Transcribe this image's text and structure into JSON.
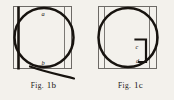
{
  "page": {
    "background_color": "#f3f1ec",
    "ink_color": "#17130f"
  },
  "figures": [
    {
      "id": "fig-1b",
      "caption_prefix": "Fig.",
      "caption_number": "1b",
      "caption_full": "Fig. 1b",
      "labels": [
        {
          "text": "a",
          "position": "top-inside-circle"
        },
        {
          "text": "b",
          "position": "bottom-inside-circle"
        }
      ],
      "elements": [
        "square-frame",
        "inscribed-circle",
        "thick-vertical-chord-left",
        "thin-vertical-line-right",
        "curved-tail-bottom-right"
      ]
    },
    {
      "id": "fig-1c",
      "caption_prefix": "Fig.",
      "caption_number": "1c",
      "caption_full": "Fig. 1c",
      "labels": [
        {
          "text": "c",
          "position": "inner-bracket-upper"
        },
        {
          "text": "d",
          "position": "inner-bracket-lower"
        }
      ],
      "elements": [
        "square-frame",
        "inscribed-circle",
        "thin-vertical-line-left",
        "thin-vertical-line-right",
        "inner-bracket-shape"
      ]
    }
  ]
}
